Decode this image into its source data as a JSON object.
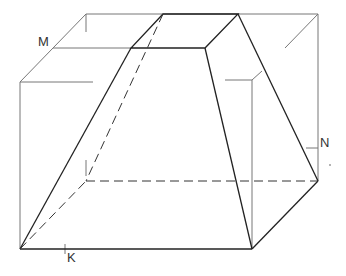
{
  "diagram": {
    "title": "",
    "labels": {
      "M": "M",
      "N": "N",
      "K": "K"
    },
    "colors": {
      "edge_visible": "#222222",
      "edge_box": "#777777",
      "edge_hidden": "#333333",
      "background": "#ffffff"
    }
  }
}
